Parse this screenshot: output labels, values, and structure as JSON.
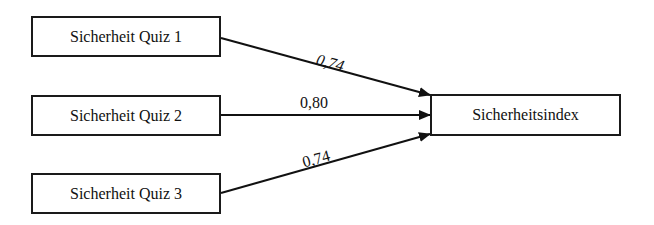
{
  "diagram": {
    "sources": [
      {
        "label": "Sicherheit Quiz 1",
        "weight": "0,74"
      },
      {
        "label": "Sicherheit Quiz 2",
        "weight": "0,80"
      },
      {
        "label": "Sicherheit Quiz 3",
        "weight": "0,74"
      }
    ],
    "target": {
      "label": "Sicherheitsindex"
    }
  }
}
